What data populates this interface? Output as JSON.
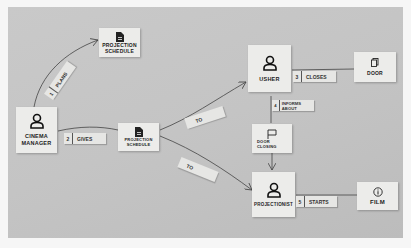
{
  "diagram": {
    "type": "concept-map",
    "nodes": [
      {
        "id": "cinema-manager",
        "label": "Cinema Manager",
        "icon": "person-icon"
      },
      {
        "id": "projection-schedule-top",
        "label": "Projection Schedule",
        "icon": "document-icon"
      },
      {
        "id": "projection-schedule-mid",
        "label": "Projection Schedule",
        "icon": "document-icon"
      },
      {
        "id": "usher",
        "label": "Usher",
        "icon": "person-icon"
      },
      {
        "id": "door",
        "label": "Door",
        "icon": "copy-icon"
      },
      {
        "id": "door-closing",
        "label": "Door Closing",
        "icon": "flag-icon"
      },
      {
        "id": "projectionist",
        "label": "Projectionist",
        "icon": "person-icon"
      },
      {
        "id": "film",
        "label": "Film",
        "icon": "info-icon"
      }
    ],
    "edges": [
      {
        "from": "cinema-manager",
        "to": "projection-schedule-top",
        "num": "1",
        "label": "Plans"
      },
      {
        "from": "cinema-manager",
        "to": "projection-schedule-mid",
        "num": "2",
        "label": "Gives"
      },
      {
        "from": "projection-schedule-mid",
        "to": "usher",
        "num": "",
        "label": "To"
      },
      {
        "from": "projection-schedule-mid",
        "to": "projectionist",
        "num": "",
        "label": "To"
      },
      {
        "from": "usher",
        "to": "door",
        "num": "3",
        "label": "Closes"
      },
      {
        "from": "usher",
        "to": "door-closing",
        "num": "4",
        "label": "Informs about"
      },
      {
        "from": "door-closing",
        "to": "projectionist",
        "num": "",
        "label": ""
      },
      {
        "from": "projectionist",
        "to": "film",
        "num": "5",
        "label": "Starts"
      }
    ]
  }
}
